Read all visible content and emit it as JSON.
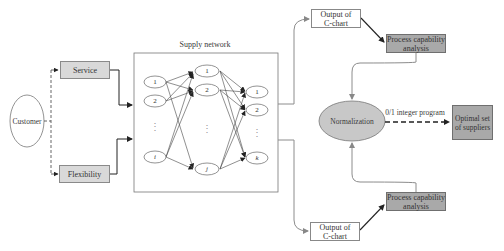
{
  "diagram": {
    "type": "flowchart",
    "customer": {
      "label": "Customer"
    },
    "criteria": [
      {
        "label": "Service"
      },
      {
        "label": "Flexibility"
      }
    ],
    "supply_network": {
      "title": "Supply network",
      "columns": [
        {
          "nodes": [
            "1",
            "2",
            "i"
          ],
          "ellipsis": "⋮"
        },
        {
          "nodes": [
            "1",
            "2",
            "j"
          ],
          "ellipsis": "⋮"
        },
        {
          "nodes": [
            "1",
            "2",
            "k"
          ],
          "ellipsis": "⋮"
        }
      ]
    },
    "outputs": [
      {
        "line1": "Output of",
        "line2": "C-chart"
      },
      {
        "line1": "Output of",
        "line2": "C-chart"
      }
    ],
    "process_capability": [
      {
        "line1": "Process capability",
        "line2": "analysis"
      },
      {
        "line1": "Process capability",
        "line2": "analysis"
      }
    ],
    "normalization": {
      "label": "Normalization"
    },
    "edge_label": "0/1 integer program",
    "result": {
      "line1": "Optimal set",
      "line2": "of suppliers"
    }
  },
  "colors": {
    "light_box": "#d9d9d9",
    "dark_box": "#a9a9a9",
    "ellipse_fill": "#c8c8c8",
    "line": "#333333",
    "gray_line": "#8c8c8c"
  }
}
